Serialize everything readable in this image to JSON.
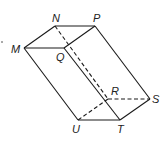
{
  "diagram": {
    "vertices": {
      "M": {
        "label": "M",
        "x": 24,
        "y": 48
      },
      "N": {
        "label": "N",
        "x": 55,
        "y": 26
      },
      "P": {
        "label": "P",
        "x": 95,
        "y": 26
      },
      "Q": {
        "label": "Q",
        "x": 64,
        "y": 48
      },
      "R": {
        "label": "R",
        "x": 108,
        "y": 99
      },
      "S": {
        "label": "S",
        "x": 150,
        "y": 99
      },
      "U": {
        "label": "U",
        "x": 78,
        "y": 120
      },
      "T": {
        "label": "T",
        "x": 120,
        "y": 120
      }
    },
    "visible_edges": [
      "MN",
      "NP",
      "PQ",
      "QM",
      "PS",
      "QT",
      "MU",
      "UT",
      "TS"
    ],
    "hidden_edges": [
      "NR",
      "RS",
      "RU"
    ],
    "line_color": "#1a1a1a"
  }
}
